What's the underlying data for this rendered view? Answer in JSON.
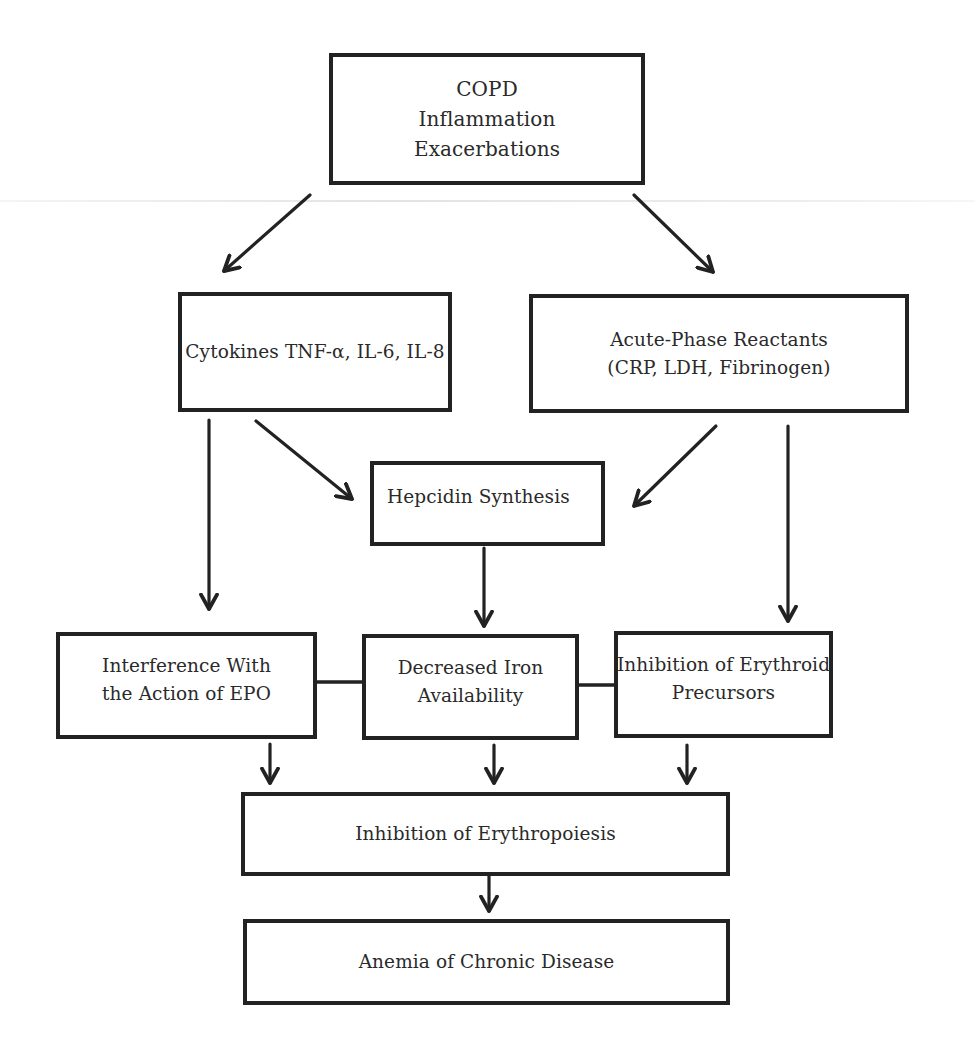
{
  "diagram": {
    "nodes": {
      "copd": {
        "lines": [
          "COPD",
          "Inflammation",
          "Exacerbations"
        ]
      },
      "cytokines": {
        "lines": [
          "Cytokines TNF-α, IL-6, IL-8"
        ]
      },
      "acute_phase": {
        "lines": [
          "Acute-Phase Reactants",
          "(CRP, LDH, Fibrinogen)"
        ]
      },
      "hepcidin": {
        "lines": [
          "Hepcidin Synthesis"
        ]
      },
      "epo": {
        "lines": [
          "Interference With",
          "the Action of EPO"
        ]
      },
      "iron": {
        "lines": [
          "Decreased Iron",
          "Availability"
        ]
      },
      "erythroid": {
        "lines": [
          "Inhibition of Erythroid",
          "Precursors"
        ]
      },
      "erythropoiesis": {
        "lines": [
          "Inhibition of Erythropoiesis"
        ]
      },
      "anemia": {
        "lines": [
          "Anemia of Chronic Disease"
        ]
      }
    },
    "edges": [
      {
        "from": "copd",
        "to": "cytokines",
        "type": "arrow"
      },
      {
        "from": "copd",
        "to": "acute_phase",
        "type": "arrow"
      },
      {
        "from": "cytokines",
        "to": "hepcidin",
        "type": "arrow"
      },
      {
        "from": "acute_phase",
        "to": "hepcidin",
        "type": "arrow"
      },
      {
        "from": "cytokines",
        "to": "epo",
        "type": "arrow"
      },
      {
        "from": "acute_phase",
        "to": "erythroid",
        "type": "arrow"
      },
      {
        "from": "hepcidin",
        "to": "iron",
        "type": "arrow"
      },
      {
        "from": "epo",
        "to": "iron",
        "type": "line"
      },
      {
        "from": "iron",
        "to": "erythroid",
        "type": "line"
      },
      {
        "from": "epo",
        "to": "erythropoiesis",
        "type": "arrow"
      },
      {
        "from": "iron",
        "to": "erythropoiesis",
        "type": "arrow"
      },
      {
        "from": "erythroid",
        "to": "erythropoiesis",
        "type": "arrow"
      },
      {
        "from": "erythropoiesis",
        "to": "anemia",
        "type": "arrow"
      }
    ],
    "colors": {
      "stroke": "#222222",
      "text": "#2a2a2a",
      "background": "#ffffff"
    }
  }
}
